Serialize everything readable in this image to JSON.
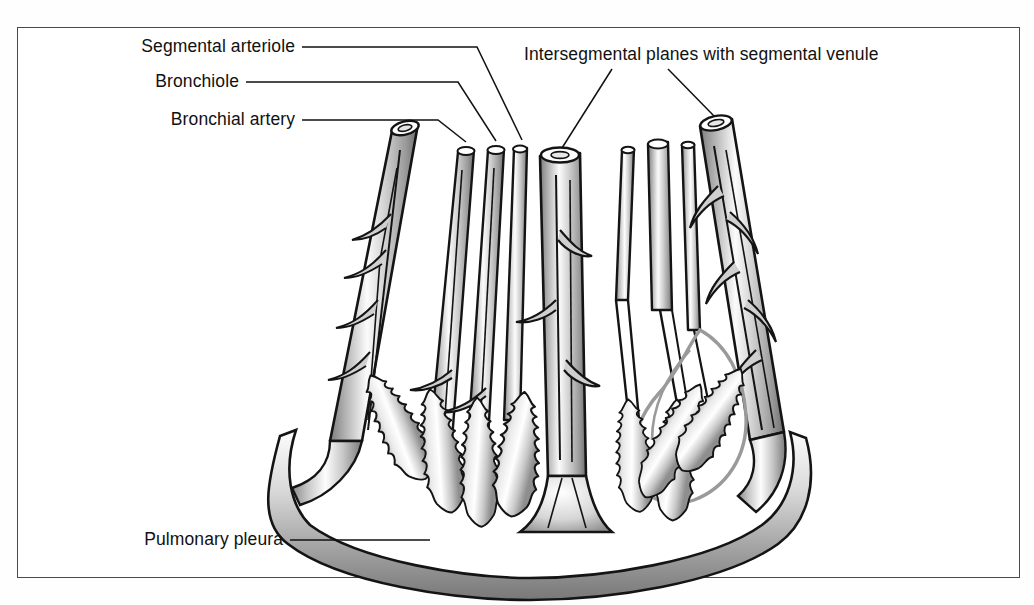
{
  "figure": {
    "type": "anatomical-diagram",
    "background_color": "#ffffff",
    "frame_color": "#4a4a4a",
    "ink_color": "#111111",
    "segment_highlight_color": "#9a9a9a",
    "shading_light": "#ffffff",
    "shading_mid": "#b9b9b9",
    "shading_dark": "#6f6f6f"
  },
  "labels": {
    "segmental_arteriole": "Segmental arteriole",
    "bronchiole": "Bronchiole",
    "bronchial_artery": "Bronchial artery",
    "intersegmental": "Intersegmental planes with segmental venule",
    "pulmonary_pleura": "Pulmonary pleura"
  },
  "structures": {
    "bronchial_artery_tube": "bronchial-artery-tube",
    "bronchiole_tube": "bronchiole-tube",
    "segmental_arteriole_tube": "segmental-arteriole-tube",
    "central_bronchiole": "central-bronchiole-tube",
    "segmental_venule_left": "segmental-venule-left",
    "segmental_venule_right": "segmental-venule-right",
    "alveolar_sac": "alveolar-sac",
    "pleura_band": "pulmonary-pleura-band",
    "segment_outline": "bronchopulmonary-segment-outline"
  },
  "leader_lines": {
    "segmental_arteriole": "leader-segmental-arteriole",
    "bronchiole": "leader-bronchiole",
    "bronchial_artery": "leader-bronchial-artery",
    "intersegmental_left": "leader-intersegmental-left",
    "intersegmental_right": "leader-intersegmental-right",
    "pulmonary_pleura": "leader-pulmonary-pleura"
  }
}
